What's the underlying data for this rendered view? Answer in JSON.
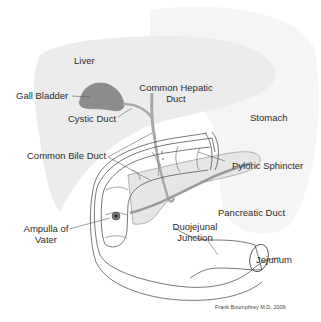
{
  "labels": {
    "liver": "Liver",
    "gall_bladder": "Gall Bladder",
    "common_hepatic_duct_1": "Common Hepatic",
    "common_hepatic_duct_2": "Duct",
    "cystic_duct": "Cystic Duct",
    "stomach": "Stomach",
    "common_bile_duct": "Common Bile Duct",
    "pyloric_sphincter": "Pyloric Sphincter",
    "pancreatic_duct": "Pancreatic Duct",
    "ampulla_1": "Ampulla of",
    "ampulla_2": "Vater",
    "duojejunal_1": "Duojejunal",
    "duojejunal_2": "Junction",
    "jejunum": "Jejunum"
  },
  "credit": "Frank Boumphrey M.D. 2009",
  "colors": {
    "liver_fill": "#ececec",
    "stomach_fill": "#f4f4f4",
    "gall_bladder_fill": "#8c8c8c",
    "pancreas_fill": "#e6e6e6",
    "duct_stroke": "#a8a8a8",
    "outline_stroke": "#555555"
  }
}
